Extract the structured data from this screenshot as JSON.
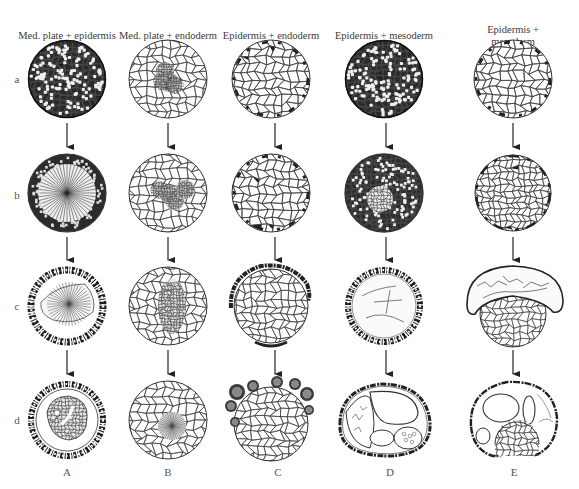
{
  "figure": {
    "columns": [
      {
        "letter": "A",
        "title": "Med. plate + epidermis",
        "x": 67
      },
      {
        "letter": "B",
        "title": "Med. plate + endoderm",
        "x": 168
      },
      {
        "letter": "C",
        "title": "Epidermis + endoderm",
        "x": 271
      },
      {
        "letter": "D",
        "title": "Epidermis + mesoderm",
        "x": 384
      },
      {
        "letter": "E",
        "title": "Epidermis + mesoderm\n+ endoderm",
        "x": 513
      }
    ],
    "rows": [
      {
        "label": "a",
        "y": 79
      },
      {
        "label": "b",
        "y": 193
      },
      {
        "label": "c",
        "y": 306
      },
      {
        "label": "d",
        "y": 420
      }
    ],
    "stages": {
      "A": [
        "dense-dark",
        "radial-dark",
        "ring-radial",
        "ring-inner-mass"
      ],
      "B": [
        "light-patchy",
        "light-patchy",
        "light-central",
        "light-radial"
      ],
      "C": [
        "light-dark-edge",
        "light-dark-edge",
        "light-cap",
        "light-cap-heavy"
      ],
      "D": [
        "dense-dark",
        "dense-central",
        "ring-hollow",
        "oval-vesicles"
      ],
      "E": [
        "light-dark-edge",
        "light-fine",
        "cap-dome",
        "dome-vesicles"
      ]
    }
  }
}
